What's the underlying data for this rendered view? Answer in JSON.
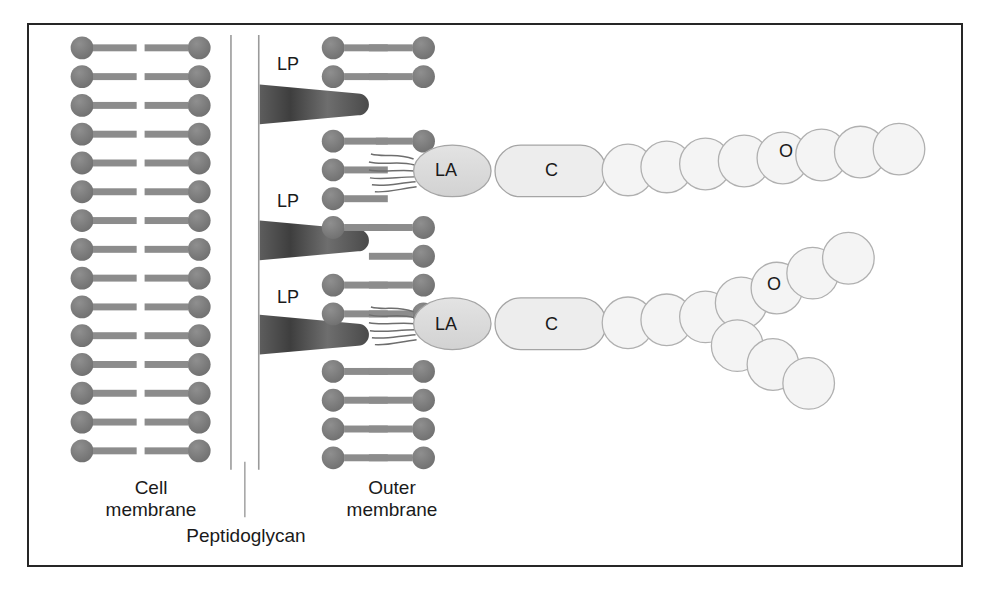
{
  "figure": {
    "background": "#ffffff",
    "border_color": "#262626"
  },
  "palette": {
    "lipid_head": "#7c7c7c",
    "lipid_tail": "#8c8c8c",
    "lp_dark": "#3a3a3a",
    "lp_light": "#9a9a9a",
    "lipid_a_fill": "#dcdcdc",
    "core_fill": "#ededed",
    "o_antigen_fill": "#f4f4f4",
    "outline": "#9a9a9a",
    "text": "#1a1a1a",
    "peptidoglycan_line": "#9a9a9a"
  },
  "labels": {
    "cell_membrane": "Cell\nmembrane",
    "outer_membrane": "Outer\nmembrane",
    "peptidoglycan": "Peptidoglycan"
  },
  "components": {
    "lipoprotein_tag": "LP",
    "lipid_a_tag": "LA",
    "core_tag": "C",
    "o_antigen_tag": "O"
  },
  "lipoproteins": [
    {
      "label": "LP",
      "label_x": 276,
      "label_y": 55,
      "wedge_y": 98
    },
    {
      "label": "LP",
      "label_x": 276,
      "label_y": 192,
      "wedge_y": 235
    },
    {
      "label": "LP",
      "label_x": 276,
      "label_y": 288,
      "wedge_y": 330
    }
  ],
  "lps_chains": [
    {
      "lipid_a": "LA",
      "core": "C",
      "o_antigen": "O",
      "branched": false,
      "o_label_x": 787,
      "o_label_y": 161
    },
    {
      "lipid_a": "LA",
      "core": "C",
      "o_antigen": "O",
      "branched": true,
      "o_label_x": 775,
      "o_label_y": 292
    }
  ],
  "structure": {
    "cell_membrane_lipid_pairs": 16,
    "outer_membrane_lipid_pairs": 16,
    "peptidoglycan_lines": 2,
    "o_antigen_units_top": 9,
    "o_antigen_units_bottom_upper_arm": 7,
    "o_antigen_units_bottom_lower_arm": 5
  }
}
